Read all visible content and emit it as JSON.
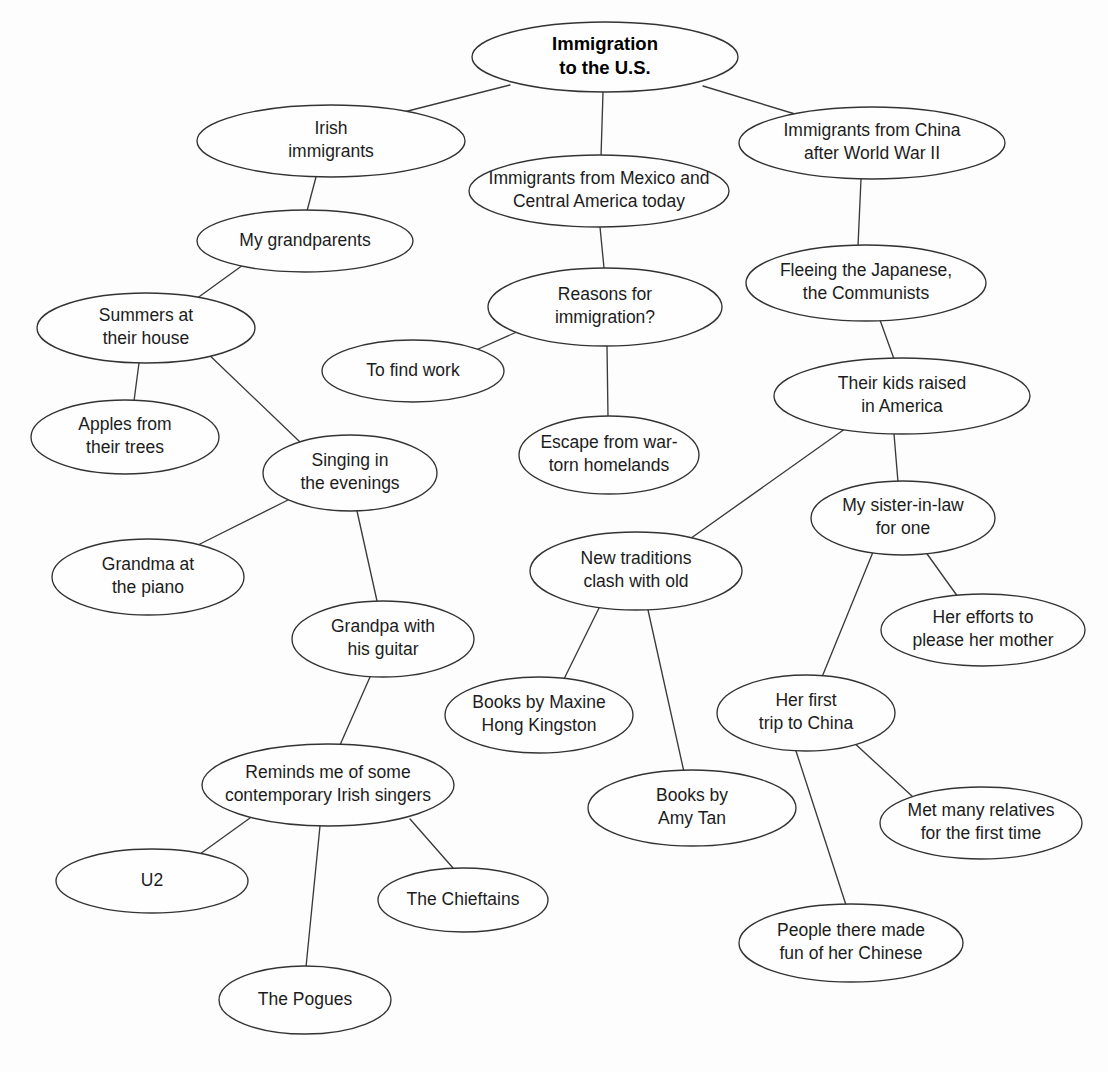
{
  "diagram": {
    "type": "mind-map",
    "background_color": "#fdfdfd",
    "node_fill_color": "#fefefe",
    "node_stroke_color": "#333333",
    "edge_color": "#3a3a3a",
    "text_color": "#1c1c1c",
    "nodes": [
      {
        "id": "root",
        "line1": "Immigration",
        "line2": "to the U.S.",
        "cx": 605,
        "cy": 57,
        "rx": 133,
        "ry": 35,
        "bold": true
      },
      {
        "id": "irish",
        "line1": "Irish",
        "line2": "immigrants",
        "cx": 331,
        "cy": 141,
        "rx": 134,
        "ry": 36
      },
      {
        "id": "grandparents",
        "line1": "My grandparents",
        "line2": "",
        "cx": 305,
        "cy": 241,
        "rx": 108,
        "ry": 31
      },
      {
        "id": "summers",
        "line1": "Summers at",
        "line2": "their house",
        "cx": 146,
        "cy": 328,
        "rx": 109,
        "ry": 35
      },
      {
        "id": "apples",
        "line1": "Apples from",
        "line2": "their trees",
        "cx": 125,
        "cy": 437,
        "rx": 94,
        "ry": 37
      },
      {
        "id": "singing",
        "line1": "Singing in",
        "line2": "the evenings",
        "cx": 350,
        "cy": 473,
        "rx": 87,
        "ry": 38
      },
      {
        "id": "grandma-piano",
        "line1": "Grandma at",
        "line2": "the piano",
        "cx": 148,
        "cy": 577,
        "rx": 96,
        "ry": 38
      },
      {
        "id": "grandpa-guitar",
        "line1": "Grandpa with",
        "line2": "his guitar",
        "cx": 383,
        "cy": 639,
        "rx": 91,
        "ry": 38
      },
      {
        "id": "irish-singers",
        "line1": "Reminds me of some",
        "line2": "contemporary Irish singers",
        "cx": 328,
        "cy": 785,
        "rx": 126,
        "ry": 41
      },
      {
        "id": "u2",
        "line1": "U2",
        "line2": "",
        "cx": 152,
        "cy": 881,
        "rx": 96,
        "ry": 32
      },
      {
        "id": "chieftains",
        "line1": "The Chieftains",
        "line2": "",
        "cx": 463,
        "cy": 900,
        "rx": 85,
        "ry": 32
      },
      {
        "id": "pogues",
        "line1": "The Pogues",
        "line2": "",
        "cx": 305,
        "cy": 1000,
        "rx": 86,
        "ry": 34
      },
      {
        "id": "mexico",
        "line1": "Immigrants from Mexico and",
        "line2": "Central America today",
        "cx": 599,
        "cy": 191,
        "rx": 130,
        "ry": 36
      },
      {
        "id": "reasons",
        "line1": "Reasons for",
        "line2": "immigration?",
        "cx": 605,
        "cy": 307,
        "rx": 117,
        "ry": 39
      },
      {
        "id": "find-work",
        "line1": "To find work",
        "line2": "",
        "cx": 413,
        "cy": 371,
        "rx": 91,
        "ry": 31
      },
      {
        "id": "escape-war",
        "line1": "Escape from war-",
        "line2": "torn homelands",
        "cx": 609,
        "cy": 455,
        "rx": 90,
        "ry": 39
      },
      {
        "id": "china",
        "line1": "Immigrants from China",
        "line2": "after World War II",
        "cx": 872,
        "cy": 143,
        "rx": 133,
        "ry": 36
      },
      {
        "id": "fleeing",
        "line1": "Fleeing the Japanese,",
        "line2": "the Communists",
        "cx": 866,
        "cy": 283,
        "rx": 120,
        "ry": 38
      },
      {
        "id": "kids-raised",
        "line1": "Their kids raised",
        "line2": "in America",
        "cx": 902,
        "cy": 396,
        "rx": 128,
        "ry": 38
      },
      {
        "id": "sister-in-law",
        "line1": "My sister-in-law",
        "line2": "for one",
        "cx": 903,
        "cy": 518,
        "rx": 92,
        "ry": 37
      },
      {
        "id": "her-efforts",
        "line1": "Her efforts to",
        "line2": "please her mother",
        "cx": 983,
        "cy": 630,
        "rx": 102,
        "ry": 36
      },
      {
        "id": "new-traditions",
        "line1": "New traditions",
        "line2": "clash with old",
        "cx": 636,
        "cy": 571,
        "rx": 106,
        "ry": 39
      },
      {
        "id": "maxine",
        "line1": "Books by Maxine",
        "line2": "Hong Kingston",
        "cx": 539,
        "cy": 715,
        "rx": 94,
        "ry": 38
      },
      {
        "id": "amy-tan",
        "line1": "Books by",
        "line2": "Amy Tan",
        "cx": 692,
        "cy": 808,
        "rx": 104,
        "ry": 38
      },
      {
        "id": "first-trip",
        "line1": "Her first",
        "line2": "trip to China",
        "cx": 806,
        "cy": 713,
        "rx": 89,
        "ry": 38
      },
      {
        "id": "met-relatives",
        "line1": "Met many relatives",
        "line2": "for the first time",
        "cx": 981,
        "cy": 823,
        "rx": 101,
        "ry": 36
      },
      {
        "id": "made-fun",
        "line1": "People there made",
        "line2": "fun of her Chinese",
        "cx": 851,
        "cy": 943,
        "rx": 112,
        "ry": 39
      }
    ],
    "edges": [
      {
        "from": "root",
        "to": "irish",
        "x1": 510,
        "y1": 85,
        "x2": 400,
        "y2": 113
      },
      {
        "from": "root",
        "to": "mexico",
        "x1": 603,
        "y1": 92,
        "x2": 601,
        "y2": 157
      },
      {
        "from": "root",
        "to": "china",
        "x1": 703,
        "y1": 86,
        "x2": 795,
        "y2": 114
      },
      {
        "from": "irish",
        "to": "grandparents",
        "x1": 316,
        "y1": 177,
        "x2": 307,
        "y2": 211
      },
      {
        "from": "grandparents",
        "to": "summers",
        "x1": 243,
        "y1": 265,
        "x2": 196,
        "y2": 299
      },
      {
        "from": "summers",
        "to": "apples",
        "x1": 139,
        "y1": 363,
        "x2": 134,
        "y2": 401
      },
      {
        "from": "summers",
        "to": "singing",
        "x1": 204,
        "y1": 350,
        "x2": 300,
        "y2": 442
      },
      {
        "from": "singing",
        "to": "grandma-piano",
        "x1": 288,
        "y1": 500,
        "x2": 196,
        "y2": 546
      },
      {
        "from": "singing",
        "to": "grandpa-guitar",
        "x1": 357,
        "y1": 511,
        "x2": 377,
        "y2": 601
      },
      {
        "from": "grandpa-guitar",
        "to": "irish-singers",
        "x1": 370,
        "y1": 677,
        "x2": 340,
        "y2": 745
      },
      {
        "from": "irish-singers",
        "to": "u2",
        "x1": 250,
        "y1": 818,
        "x2": 200,
        "y2": 854
      },
      {
        "from": "irish-singers",
        "to": "chieftains",
        "x1": 410,
        "y1": 819,
        "x2": 453,
        "y2": 868
      },
      {
        "from": "irish-singers",
        "to": "pogues",
        "x1": 320,
        "y1": 826,
        "x2": 306,
        "y2": 967
      },
      {
        "from": "mexico",
        "to": "reasons",
        "x1": 600,
        "y1": 227,
        "x2": 604,
        "y2": 268
      },
      {
        "from": "reasons",
        "to": "find-work",
        "x1": 519,
        "y1": 331,
        "x2": 467,
        "y2": 354
      },
      {
        "from": "reasons",
        "to": "escape-war",
        "x1": 607,
        "y1": 346,
        "x2": 608,
        "y2": 417
      },
      {
        "from": "china",
        "to": "fleeing",
        "x1": 861,
        "y1": 179,
        "x2": 858,
        "y2": 246
      },
      {
        "from": "fleeing",
        "to": "kids-raised",
        "x1": 880,
        "y1": 320,
        "x2": 894,
        "y2": 359
      },
      {
        "from": "kids-raised",
        "to": "new-traditions",
        "x1": 849,
        "y1": 426,
        "x2": 687,
        "y2": 541
      },
      {
        "from": "kids-raised",
        "to": "sister-in-law",
        "x1": 894,
        "y1": 434,
        "x2": 898,
        "y2": 482
      },
      {
        "from": "sister-in-law",
        "to": "her-efforts",
        "x1": 925,
        "y1": 551,
        "x2": 958,
        "y2": 597
      },
      {
        "from": "sister-in-law",
        "to": "first-trip",
        "x1": 873,
        "y1": 552,
        "x2": 822,
        "y2": 677
      },
      {
        "from": "new-traditions",
        "to": "maxine",
        "x1": 600,
        "y1": 606,
        "x2": 563,
        "y2": 681
      },
      {
        "from": "new-traditions",
        "to": "amy-tan",
        "x1": 648,
        "y1": 610,
        "x2": 684,
        "y2": 772
      },
      {
        "from": "first-trip",
        "to": "met-relatives",
        "x1": 852,
        "y1": 741,
        "x2": 913,
        "y2": 797
      },
      {
        "from": "first-trip",
        "to": "made-fun",
        "x1": 796,
        "y1": 751,
        "x2": 846,
        "y2": 905
      }
    ]
  }
}
